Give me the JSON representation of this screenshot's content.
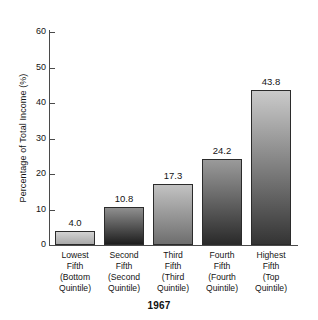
{
  "chart_data": {
    "type": "bar",
    "title": "1967",
    "xlabel": "",
    "ylabel": "Percentage of Total Income (%)",
    "ylim": [
      0,
      60
    ],
    "ytick_step": 10,
    "yticks": [
      60,
      50,
      40,
      30,
      20,
      10,
      0
    ],
    "grid": false,
    "legend": "none",
    "categories": [
      "Lowest Fifth (Bottom Quintile)",
      "Second Fifth (Second Quintile)",
      "Third Fifth (Third Quintile)",
      "Fourth Fifth (Fourth Quintile)",
      "Highest Fifth (Top Quintile)"
    ],
    "category_lines": [
      [
        "Lowest",
        "Fifth",
        "(Bottom",
        "Quintile)"
      ],
      [
        "Second",
        "Fifth",
        "(Second",
        "Quintile)"
      ],
      [
        "Third",
        "Fifth",
        "(Third",
        "Quintile)"
      ],
      [
        "Fourth",
        "Fifth",
        "(Fourth",
        "Quintile)"
      ],
      [
        "Highest",
        "Fifth",
        "(Top",
        "Quintile)"
      ]
    ],
    "values": [
      4.0,
      10.8,
      17.3,
      24.2,
      43.8
    ],
    "value_labels": [
      "4.0",
      "10.8",
      "17.3",
      "24.2",
      "43.8"
    ],
    "bar_colors_top": [
      "#d2d2d2",
      "#8f8f8f",
      "#c2c2c2",
      "#9a9a9a",
      "#cacaca"
    ],
    "bar_colors_bottom": [
      "#a9a9a9",
      "#1e1e1e",
      "#6e6e6e",
      "#2a2a2a",
      "#343434"
    ],
    "bar_border_color": "#2b2b2b",
    "axis_color": "#4a4a4a",
    "text_color": "#141414",
    "background": "#ffffff"
  }
}
